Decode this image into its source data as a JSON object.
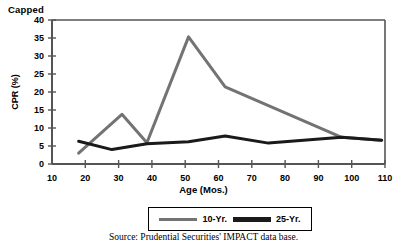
{
  "figure": {
    "top_caption": "Capped",
    "source_note": "Source: Prudential Securities' IMPACT data base."
  },
  "chart_data": {
    "type": "line",
    "title": "Capped",
    "xlabel": "Age (Mos.)",
    "ylabel": "CPR (%)",
    "xlim": [
      10,
      110
    ],
    "ylim": [
      0,
      40
    ],
    "xticks": [
      10,
      20,
      30,
      40,
      50,
      60,
      70,
      80,
      90,
      100,
      110
    ],
    "yticks": [
      0,
      5,
      10,
      15,
      20,
      25,
      30,
      35,
      40
    ],
    "grid": false,
    "legend_position": "bottom",
    "series": [
      {
        "name": "10-Yr.",
        "color": "#737373",
        "linewidth": 3,
        "points": [
          {
            "x": 18,
            "y": 3.0
          },
          {
            "x": 31,
            "y": 13.8
          },
          {
            "x": 38.5,
            "y": 5.9
          },
          {
            "x": 51,
            "y": 35.3
          },
          {
            "x": 62,
            "y": 21.4
          },
          {
            "x": 97,
            "y": 7.4
          },
          {
            "x": 109,
            "y": 6.6
          }
        ]
      },
      {
        "name": "25-Yr.",
        "color": "#1a1a1a",
        "linewidth": 3,
        "points": [
          {
            "x": 18,
            "y": 6.3
          },
          {
            "x": 28,
            "y": 4.0
          },
          {
            "x": 38.5,
            "y": 5.6
          },
          {
            "x": 51,
            "y": 6.2
          },
          {
            "x": 62,
            "y": 7.8
          },
          {
            "x": 75,
            "y": 5.8
          },
          {
            "x": 97,
            "y": 7.4
          },
          {
            "x": 109,
            "y": 6.6
          }
        ]
      }
    ]
  },
  "legend": {
    "items": [
      {
        "label": "10-Yr.",
        "color": "#737373"
      },
      {
        "label": "25-Yr.",
        "color": "#1a1a1a"
      }
    ]
  },
  "axes": {
    "x_title": "Age (Mos.)",
    "y_title": "CPR (%)"
  }
}
